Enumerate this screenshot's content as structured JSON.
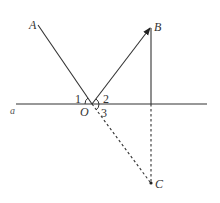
{
  "diagram": {
    "type": "geometry",
    "colors": {
      "stroke": "#333333",
      "background": "#ffffff"
    },
    "points": {
      "A": {
        "label": "A",
        "x": 38,
        "y": 25
      },
      "B": {
        "label": "B",
        "x": 151,
        "y": 27
      },
      "O": {
        "label": "O",
        "x": 92,
        "y": 104
      },
      "C": {
        "label": "C",
        "x": 151,
        "y": 183
      }
    },
    "line_a": {
      "label": "a",
      "x1": 16,
      "x2": 207,
      "y": 104
    },
    "angles": [
      {
        "label": "1"
      },
      {
        "label": "2"
      },
      {
        "label": "3"
      }
    ],
    "segments": [
      {
        "from": "A",
        "to": "O",
        "style": "solid"
      },
      {
        "from": "O",
        "to": "B",
        "style": "solid-arrow"
      },
      {
        "from": "B",
        "to": "foot",
        "style": "solid"
      },
      {
        "from": "foot",
        "to": "C",
        "style": "dashed"
      },
      {
        "from": "O",
        "to": "C",
        "style": "dashed"
      }
    ]
  }
}
